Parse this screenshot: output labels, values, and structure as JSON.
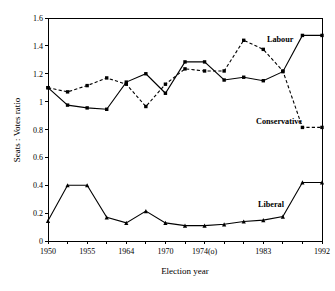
{
  "chart_data": {
    "type": "line",
    "title": "",
    "xlabel": "Election year",
    "ylabel": "Seats : Votes ratio",
    "ylim": [
      0,
      1.6
    ],
    "yticks": [
      0,
      0.2,
      0.4,
      0.6,
      0.8,
      1.0,
      1.2,
      1.4,
      1.6
    ],
    "ytick_labels": [
      "0",
      "0.2",
      "0.4",
      "0.6",
      "0.8",
      "1",
      "1.2",
      "1.4",
      "1.6"
    ],
    "grid": false,
    "legend_position": "inline-annotation",
    "x_index": [
      0,
      1,
      2,
      3,
      4,
      5,
      6,
      7,
      8,
      9,
      10,
      11,
      12,
      13,
      14
    ],
    "xtick_labels": [
      "1950",
      "",
      "1955",
      "",
      "1964",
      "",
      "1970",
      "",
      "1974(o)",
      "",
      "",
      "1983",
      "",
      "",
      "1992"
    ],
    "xtick_labelled_index": [
      0,
      2,
      4,
      6,
      8,
      11,
      14
    ],
    "series": [
      {
        "name": "Labour",
        "style": "solid",
        "marker": "square",
        "values": [
          1.1,
          0.975,
          0.955,
          0.945,
          1.14,
          1.2,
          1.06,
          1.285,
          1.285,
          1.155,
          1.175,
          1.15,
          1.215,
          1.475,
          1.475
        ]
      },
      {
        "name": "Conservative",
        "style": "dashed",
        "marker": "square",
        "values": [
          1.1,
          1.07,
          1.115,
          1.17,
          1.125,
          0.965,
          1.125,
          1.235,
          1.22,
          1.22,
          1.44,
          1.375,
          1.22,
          0.815,
          0.815
        ]
      },
      {
        "name": "Liberal",
        "style": "solid",
        "marker": "triangle",
        "values": [
          0.145,
          0.4,
          0.4,
          0.17,
          0.13,
          0.215,
          0.13,
          0.11,
          0.11,
          0.12,
          0.14,
          0.15,
          0.175,
          0.42,
          0.42
        ]
      }
    ],
    "annotations": [
      {
        "text": "Labour",
        "series": "Labour"
      },
      {
        "text": "Conservative",
        "series": "Conservative"
      },
      {
        "text": "Liberal",
        "series": "Liberal"
      }
    ]
  },
  "axes": {
    "x_title": "Election year",
    "y_title": "Seats : Votes ratio"
  },
  "labels": {
    "labour": "Labour",
    "conservative": "Conservative",
    "liberal": "Liberal"
  }
}
